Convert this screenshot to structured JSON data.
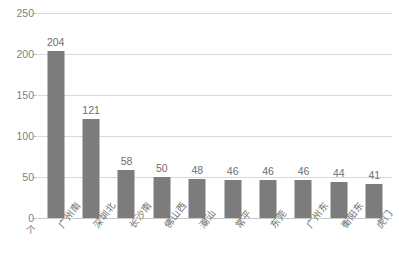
{
  "chart_data": {
    "type": "bar",
    "title": "",
    "xlabel": "",
    "ylabel": "",
    "unit_label": "个",
    "categories": [
      "广州南",
      "深圳北",
      "长沙南",
      "佛山西",
      "潮汕",
      "常平",
      "东莞",
      "广州东",
      "衡阳东",
      "虎门"
    ],
    "values": [
      204,
      121,
      58,
      50,
      48,
      46,
      46,
      46,
      44,
      41
    ],
    "value_labels": [
      "204",
      "121",
      "58",
      "50",
      "48",
      "46",
      "46",
      "46",
      "44",
      "41"
    ],
    "ylim": [
      0,
      250
    ],
    "yticks": [
      0,
      50,
      100,
      150,
      200,
      250
    ],
    "ytick_labels": [
      "0",
      "50",
      "100",
      "150",
      "200",
      "250"
    ],
    "grid": true,
    "legend": "none",
    "bar_color": "#7c7c7c",
    "gridline_color": "#d9d9d9",
    "text_color": "#6e6e6e"
  }
}
